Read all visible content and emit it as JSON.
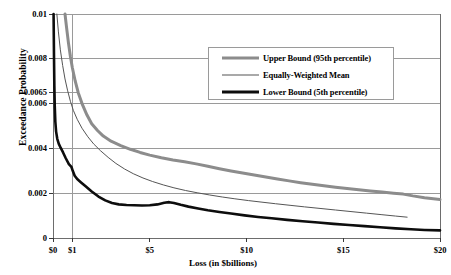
{
  "chart_data": {
    "type": "line",
    "title": "",
    "xlabel": "Loss (in $billions)",
    "ylabel": "Exceedance Probability",
    "xlim": [
      0,
      20
    ],
    "ylim": [
      0,
      0.01
    ],
    "grid": true,
    "legend_position": "top-right",
    "x_ticks": [
      {
        "value": 0,
        "label": "$0"
      },
      {
        "value": 1,
        "label": "$1"
      },
      {
        "value": 5,
        "label": "$5"
      },
      {
        "value": 10,
        "label": "$10"
      },
      {
        "value": 15,
        "label": "$15"
      },
      {
        "value": 20,
        "label": "$20"
      }
    ],
    "y_ticks": [
      {
        "value": 0,
        "label": "0"
      },
      {
        "value": 0.002,
        "label": "0.002"
      },
      {
        "value": 0.004,
        "label": "0.004"
      },
      {
        "value": 0.006,
        "label": "0.006"
      },
      {
        "value": 0.0065,
        "label": "0.0065"
      },
      {
        "value": 0.008,
        "label": "0.008"
      },
      {
        "value": 0.01,
        "label": "0.01"
      }
    ],
    "series": [
      {
        "name": "Upper Bound (95th percentile)",
        "color": "#8c8c8c",
        "width": 3,
        "points": [
          [
            0.62,
            0.01
          ],
          [
            0.7,
            0.0094
          ],
          [
            0.8,
            0.0087
          ],
          [
            0.9,
            0.0081
          ],
          [
            1.0,
            0.0076
          ],
          [
            1.15,
            0.007
          ],
          [
            1.3,
            0.0065
          ],
          [
            1.5,
            0.006
          ],
          [
            1.75,
            0.0055
          ],
          [
            2.0,
            0.0051
          ],
          [
            2.3,
            0.0048
          ],
          [
            2.6,
            0.00455
          ],
          [
            3.0,
            0.00432
          ],
          [
            3.5,
            0.00412
          ],
          [
            4.0,
            0.00396
          ],
          [
            4.5,
            0.00382
          ],
          [
            5.0,
            0.0037
          ],
          [
            5.6,
            0.00358
          ],
          [
            6.2,
            0.00348
          ],
          [
            6.8,
            0.0034
          ],
          [
            7.4,
            0.00331
          ],
          [
            8.0,
            0.0032
          ],
          [
            8.6,
            0.00309
          ],
          [
            9.2,
            0.00299
          ],
          [
            9.8,
            0.0029
          ],
          [
            10.4,
            0.00281
          ],
          [
            11.0,
            0.00272
          ],
          [
            11.6,
            0.00263
          ],
          [
            12.2,
            0.00255
          ],
          [
            12.8,
            0.00247
          ],
          [
            13.4,
            0.0024
          ],
          [
            14.0,
            0.00233
          ],
          [
            14.6,
            0.00227
          ],
          [
            15.2,
            0.00221
          ],
          [
            15.8,
            0.00215
          ],
          [
            16.4,
            0.0021
          ],
          [
            17.0,
            0.00205
          ],
          [
            17.6,
            0.002
          ],
          [
            18.1,
            0.00196
          ],
          [
            18.6,
            0.00188
          ],
          [
            19.2,
            0.0018
          ],
          [
            20.0,
            0.00172
          ]
        ]
      },
      {
        "name": "Equally-Weighted Mean",
        "color": "#555555",
        "width": 1,
        "points": [
          [
            0.2,
            0.01
          ],
          [
            0.28,
            0.0092
          ],
          [
            0.38,
            0.0084
          ],
          [
            0.5,
            0.0077
          ],
          [
            0.62,
            0.0071
          ],
          [
            0.75,
            0.0066
          ],
          [
            0.9,
            0.0061
          ],
          [
            1.05,
            0.0057
          ],
          [
            1.25,
            0.0053
          ],
          [
            1.5,
            0.0049
          ],
          [
            1.8,
            0.00452
          ],
          [
            2.1,
            0.0042
          ],
          [
            2.45,
            0.0039
          ],
          [
            2.85,
            0.0036
          ],
          [
            3.25,
            0.00333
          ],
          [
            3.7,
            0.00308
          ],
          [
            4.15,
            0.00287
          ],
          [
            4.65,
            0.00268
          ],
          [
            5.15,
            0.00252
          ],
          [
            5.7,
            0.00237
          ],
          [
            6.25,
            0.00224
          ],
          [
            6.85,
            0.00212
          ],
          [
            7.45,
            0.00202
          ],
          [
            8.1,
            0.00192
          ],
          [
            8.75,
            0.00183
          ],
          [
            9.4,
            0.00175
          ],
          [
            10.1,
            0.00167
          ],
          [
            10.8,
            0.0016
          ],
          [
            11.5,
            0.00153
          ],
          [
            12.25,
            0.00146
          ],
          [
            13.0,
            0.00139
          ],
          [
            13.8,
            0.00132
          ],
          [
            14.6,
            0.00125
          ],
          [
            15.4,
            0.00118
          ],
          [
            16.2,
            0.00111
          ],
          [
            17.0,
            0.00104
          ],
          [
            17.7,
            0.00098
          ],
          [
            18.3,
            0.00093
          ]
        ]
      },
      {
        "name": "Lower Bound (5th percentile)",
        "color": "#0d0d0d",
        "width": 2.6,
        "points": [
          [
            0.03,
            0.01
          ],
          [
            0.05,
            0.0082
          ],
          [
            0.07,
            0.0068
          ],
          [
            0.09,
            0.0059
          ],
          [
            0.12,
            0.0052
          ],
          [
            0.16,
            0.00475
          ],
          [
            0.22,
            0.00443
          ],
          [
            0.3,
            0.0042
          ],
          [
            0.4,
            0.00402
          ],
          [
            0.52,
            0.00382
          ],
          [
            0.66,
            0.00356
          ],
          [
            0.82,
            0.0033
          ],
          [
            0.95,
            0.00318
          ],
          [
            1.02,
            0.003
          ],
          [
            1.12,
            0.00278
          ],
          [
            1.25,
            0.00263
          ],
          [
            1.45,
            0.00248
          ],
          [
            1.7,
            0.0023
          ],
          [
            2.0,
            0.00208
          ],
          [
            2.35,
            0.00185
          ],
          [
            2.7,
            0.00168
          ],
          [
            3.05,
            0.00156
          ],
          [
            3.4,
            0.0015
          ],
          [
            3.8,
            0.00147
          ],
          [
            4.2,
            0.00146
          ],
          [
            4.6,
            0.00145
          ],
          [
            5.0,
            0.00146
          ],
          [
            5.4,
            0.0015
          ],
          [
            5.75,
            0.00157
          ],
          [
            6.0,
            0.0016
          ],
          [
            6.25,
            0.00156
          ],
          [
            6.6,
            0.00148
          ],
          [
            7.0,
            0.0014
          ],
          [
            7.5,
            0.00132
          ],
          [
            8.0,
            0.00124
          ],
          [
            8.6,
            0.00116
          ],
          [
            9.2,
            0.00109
          ],
          [
            9.9,
            0.00101
          ],
          [
            10.6,
            0.00094
          ],
          [
            11.3,
            0.00088
          ],
          [
            12.1,
            0.00081
          ],
          [
            12.9,
            0.00075
          ],
          [
            13.7,
            0.00069
          ],
          [
            14.5,
            0.00063
          ],
          [
            15.3,
            0.00058
          ],
          [
            16.1,
            0.00053
          ],
          [
            16.9,
            0.00048
          ],
          [
            17.7,
            0.00043
          ],
          [
            18.5,
            0.00039
          ],
          [
            19.2,
            0.00036
          ],
          [
            20.0,
            0.00034
          ]
        ]
      }
    ]
  },
  "legend": {
    "entries": [
      {
        "label": "Upper Bound (95th percentile)"
      },
      {
        "label": "Equally-Weighted Mean"
      },
      {
        "label": "Lower Bound (5th percentile)"
      }
    ]
  }
}
